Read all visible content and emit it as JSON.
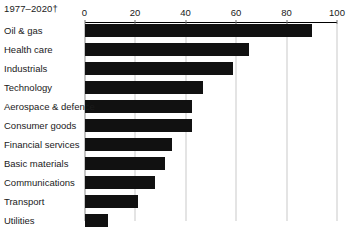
{
  "chart_data": {
    "type": "bar",
    "orientation": "horizontal",
    "title": "",
    "subtitle": "1977–2020†",
    "xlabel": "",
    "ylabel": "",
    "xlim": [
      0,
      100
    ],
    "xticks": [
      0,
      20,
      40,
      60,
      80,
      100
    ],
    "xtick_labels": [
      "0",
      "20",
      "40",
      "60",
      "80",
      "100"
    ],
    "grid": true,
    "grid_axis": "x",
    "legend": false,
    "categories": [
      "Oil & gas",
      "Health care",
      "Industrials",
      "Technology",
      "Aerospace & defence",
      "Consumer goods",
      "Financial services",
      "Basic materials",
      "Communications",
      "Transport",
      "Utilities"
    ],
    "values": [
      90,
      65,
      59,
      47,
      42.5,
      42.5,
      34.5,
      32,
      28,
      21,
      9.5
    ],
    "bar_color": "#111111"
  },
  "colors": {
    "bar": "#111111",
    "grid": "#c9c9c9",
    "zero_line": "#8a8a8a",
    "axis": "#000000",
    "text": "#1a1a1a",
    "background": "#ffffff"
  }
}
